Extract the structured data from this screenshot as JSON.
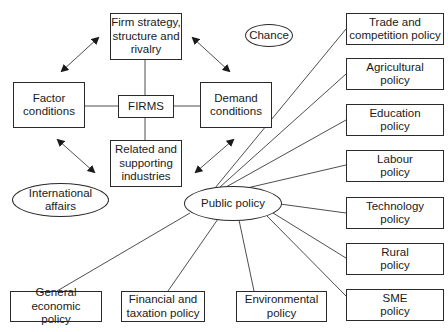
{
  "diagram": {
    "porter_diamond": {
      "firm_strategy": "Firm strategy,\nstructure and\nrivalry",
      "factor_conditions": "Factor\nconditions",
      "firms": "FIRMS",
      "demand_conditions": "Demand\nconditions",
      "related_industries": "Related and\nsupporting\nindustries"
    },
    "external": {
      "chance": "Chance",
      "international_affairs": "International\naffairs",
      "public_policy": "Public policy"
    },
    "policies_right": [
      "Trade and\ncompetition policy",
      "Agricultural\npolicy",
      "Education\npolicy",
      "Labour\npolicy",
      "Technology\npolicy",
      "Rural\npolicy",
      "SME\npolicy"
    ],
    "policies_bottom": [
      "General economic\npolicy",
      "Financial and\ntaxation policy",
      "Environmental\npolicy"
    ],
    "colors": {
      "stroke": "#2a2a2a",
      "background": "#ffffff"
    }
  }
}
